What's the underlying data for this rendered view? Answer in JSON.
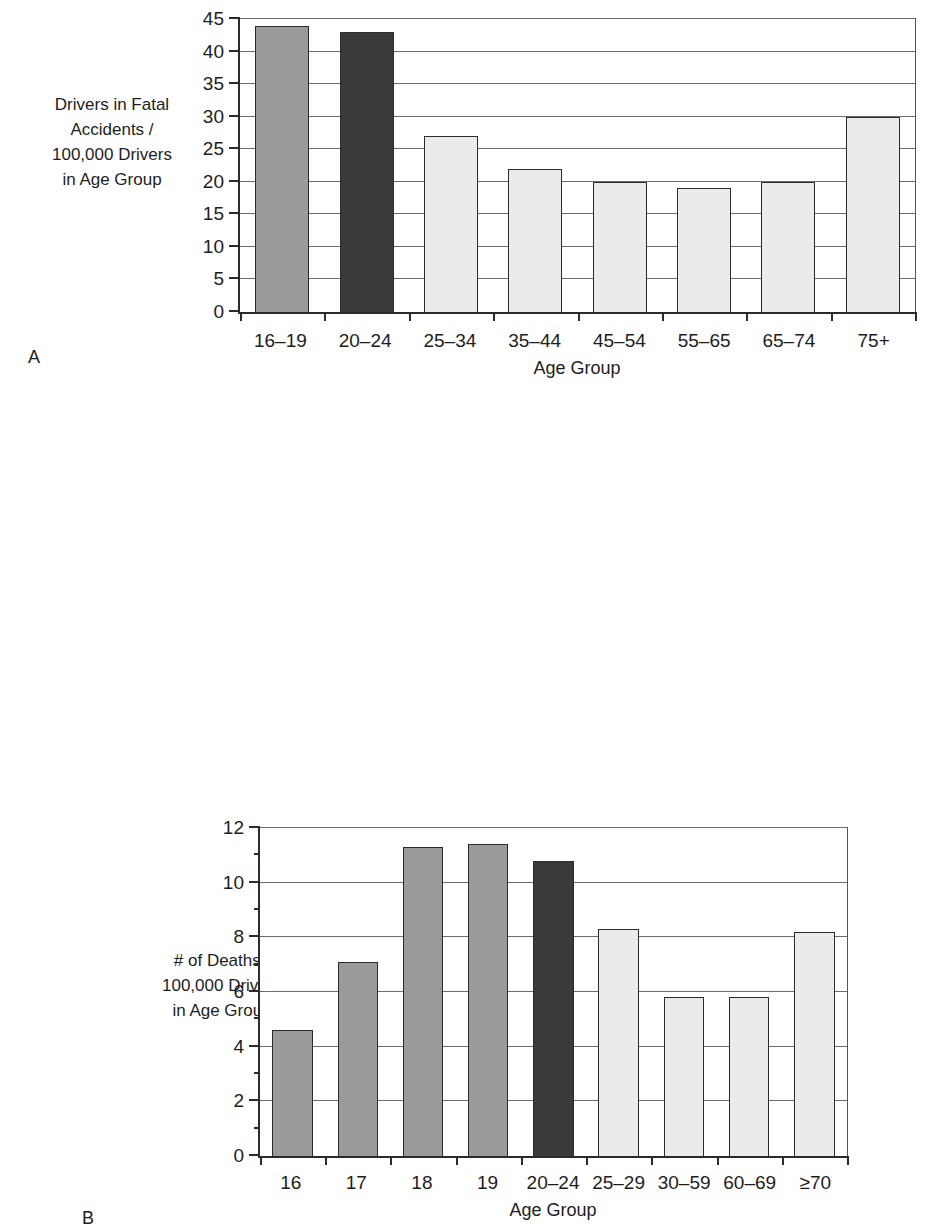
{
  "figure": {
    "panel_a_letter": "A",
    "panel_b_letter": "B"
  },
  "colors": {
    "bar_medium_gray": "#9a9a9a",
    "bar_dark": "#3a3a3a",
    "bar_light": "#ebebeb",
    "bar_outline": "#2b2b2b",
    "gridline": "#6d6d6d",
    "axis": "#2b2b2b",
    "text": "#1d1d1d",
    "background": "#ffffff"
  },
  "chart_data": [
    {
      "id": "A",
      "type": "bar",
      "title": "",
      "xlabel": "Age Group",
      "ylabel": "Drivers in Fatal Accidents / 100,000 Drivers in Age Group",
      "ylabel_lines": [
        "Drivers in Fatal",
        "Accidents /",
        "100,000 Drivers",
        "in Age Group"
      ],
      "categories": [
        "16–19",
        "20–24",
        "25–34",
        "35–44",
        "45–54",
        "55–65",
        "65–74",
        "75+"
      ],
      "values": [
        44,
        43,
        27,
        22,
        20,
        19,
        20,
        30
      ],
      "bar_colors": [
        "#9a9a9a",
        "#3a3a3a",
        "#ebebeb",
        "#ebebeb",
        "#ebebeb",
        "#ebebeb",
        "#ebebeb",
        "#ebebeb"
      ],
      "ylim": [
        0,
        45
      ],
      "yticks": [
        0,
        5,
        10,
        15,
        20,
        25,
        30,
        35,
        40,
        45
      ],
      "ytick_labels": [
        "0",
        "5",
        "10",
        "15",
        "20",
        "25",
        "30",
        "35",
        "40",
        "45"
      ],
      "gridlines": [
        5,
        10,
        15,
        20,
        25,
        30,
        35,
        40,
        45
      ],
      "grid": true,
      "legend": "none"
    },
    {
      "id": "B",
      "type": "bar",
      "title": "",
      "xlabel": "Age Group",
      "ylabel": "# of Deaths / 100,000 Drivers in Age Group",
      "ylabel_lines": [
        "# of Deaths /",
        "100,000 Drivers",
        "in Age Group"
      ],
      "categories": [
        "16",
        "17",
        "18",
        "19",
        "20–24",
        "25–29",
        "30–59",
        "60–69",
        "≥70"
      ],
      "values": [
        4.6,
        7.1,
        11.3,
        11.4,
        10.8,
        8.3,
        5.8,
        5.8,
        8.2
      ],
      "bar_colors": [
        "#9a9a9a",
        "#9a9a9a",
        "#9a9a9a",
        "#9a9a9a",
        "#3a3a3a",
        "#ebebeb",
        "#ebebeb",
        "#ebebeb",
        "#ebebeb"
      ],
      "ylim": [
        0,
        12
      ],
      "yticks": [
        0,
        2,
        4,
        6,
        8,
        10,
        12
      ],
      "ytick_labels": [
        "0",
        "2",
        "4",
        "6",
        "8",
        "10",
        "12"
      ],
      "yticks_minor": [
        1,
        3,
        5,
        7,
        9,
        11
      ],
      "gridlines": [
        2,
        4,
        6,
        8,
        10,
        12
      ],
      "grid": true,
      "legend": "none"
    }
  ]
}
